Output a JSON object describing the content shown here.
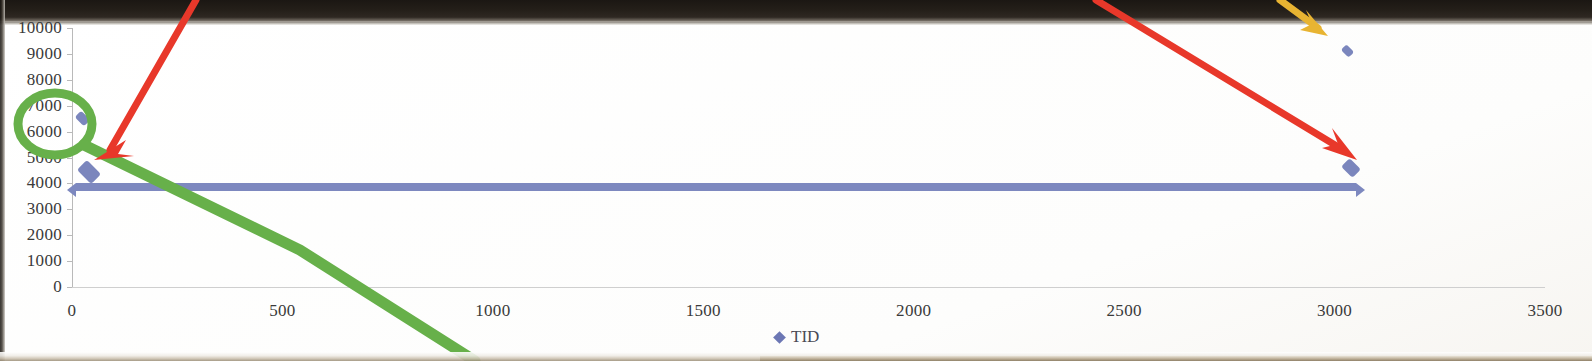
{
  "chart_data": {
    "type": "scatter",
    "title": "",
    "xlabel": "",
    "ylabel": "",
    "legend": [
      {
        "name": "TID",
        "marker": "diamond",
        "color": "#6c77b4"
      }
    ],
    "legend_position": "bottom-center",
    "grid": false,
    "xlim": [
      0,
      3500
    ],
    "ylim": [
      0,
      10000
    ],
    "xticks": [
      "0",
      "500",
      "1000",
      "1500",
      "2000",
      "2500",
      "3000",
      "3500"
    ],
    "xtick_values": [
      0,
      500,
      1000,
      1500,
      2000,
      2500,
      3000,
      3500
    ],
    "yticks": [
      "0",
      "1000",
      "2000",
      "3000",
      "4000",
      "5000",
      "6000",
      "7000",
      "8000",
      "9000",
      "10000"
    ],
    "ytick_values": [
      0,
      1000,
      2000,
      3000,
      4000,
      5000,
      6000,
      7000,
      8000,
      9000,
      10000
    ],
    "series": [
      {
        "name": "TID",
        "description": "Dense horizontal band of points spanning nearly the full TID range at a near-constant value, plus four isolated outlier points.",
        "dense_band": {
          "x_start": 10,
          "x_end": 3050,
          "y_low": 3720,
          "y_high": 4010
        },
        "outliers": [
          {
            "x": 25,
            "y": 6500,
            "note": "circled-outlier-upper-left"
          },
          {
            "x": 40,
            "y": 4450,
            "note": "arrow-marked-left"
          },
          {
            "x": 3030,
            "y": 9120,
            "note": "arrow-marked-top-right"
          },
          {
            "x": 3040,
            "y": 4600,
            "note": "arrow-marked-right"
          }
        ]
      }
    ],
    "annotations": [
      {
        "id": "green-magnifier",
        "type": "circle-with-handle",
        "color": "#67b04a",
        "target": "upper-left outlier near TID 25, value 6500"
      },
      {
        "id": "red-arrow-left",
        "type": "arrow",
        "color": "#e8382a",
        "target": "left outlier near TID 40, value 4450"
      },
      {
        "id": "red-arrow-right",
        "type": "arrow",
        "color": "#e8382a",
        "target": "right outlier near TID 3040, value 4600"
      },
      {
        "id": "gold-arrow",
        "type": "arrow",
        "color": "#e8b432",
        "target": "top-right outlier near TID 3030, value 9120"
      }
    ]
  },
  "colors": {
    "series": "#7b86bd",
    "band": "#7d88bf",
    "green_annotation": "#67b04a",
    "red_annotation": "#e8382a",
    "gold_annotation": "#e8b432",
    "axis": "#b9b9b9",
    "tick_text": "#3a3a3a"
  }
}
